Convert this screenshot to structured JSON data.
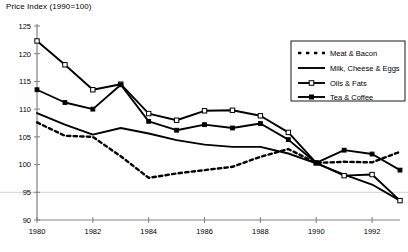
{
  "chart_data": {
    "type": "line",
    "title": "Price Index (1990=100)",
    "ylabel": "Price Index (1990=100)",
    "xlabel": "",
    "ylim": [
      90,
      125
    ],
    "xlim": [
      1980,
      1993
    ],
    "ytick_labels": [
      "90",
      "95",
      "100",
      "105",
      "110",
      "115",
      "120",
      "125"
    ],
    "yticks": [
      90,
      95,
      100,
      105,
      110,
      115,
      120,
      125
    ],
    "xtick_labels": [
      "1980",
      "1982",
      "1984",
      "1986",
      "1988",
      "1990",
      "1992"
    ],
    "xticks": [
      1980,
      1982,
      1984,
      1986,
      1988,
      1990,
      1992
    ],
    "grid": false,
    "legend_position": "top-right",
    "x": [
      1980,
      1981,
      1982,
      1983,
      1984,
      1985,
      1986,
      1987,
      1988,
      1989,
      1990,
      1991,
      1992,
      1993
    ],
    "series": [
      {
        "name": "Meat & Bacon",
        "style": "dashed",
        "marker": "none",
        "color": "#000000",
        "values": [
          107.6,
          105.2,
          105.0,
          101.5,
          97.6,
          98.4,
          99.0,
          99.6,
          101.4,
          102.8,
          100.3,
          100.5,
          100.4,
          102.3
        ]
      },
      {
        "name": "Milk, Cheese & Eggs",
        "style": "solid",
        "marker": "none",
        "color": "#000000",
        "values": [
          109.3,
          107.2,
          105.4,
          106.6,
          105.6,
          104.4,
          103.6,
          103.2,
          103.2,
          102.0,
          100.2,
          98.2,
          96.4,
          93.5
        ]
      },
      {
        "name": "Oils & Fats",
        "style": "solid",
        "marker": "square-open",
        "color": "#000000",
        "values": [
          122.3,
          118.0,
          113.5,
          114.5,
          109.2,
          108.0,
          109.7,
          109.8,
          108.8,
          105.8,
          100.3,
          98.0,
          98.2,
          93.5
        ]
      },
      {
        "name": "Tea & Coffee",
        "style": "solid",
        "marker": "square-filled",
        "color": "#000000",
        "values": [
          113.5,
          111.2,
          110.0,
          114.4,
          107.8,
          106.2,
          107.2,
          106.6,
          107.4,
          104.5,
          100.3,
          102.6,
          101.9,
          99.0
        ]
      }
    ]
  },
  "legend": {
    "entries": [
      {
        "label": "Meat & Bacon"
      },
      {
        "label": "Milk, Cheese & Eggs"
      },
      {
        "label": "Oils & Fats"
      },
      {
        "label": "Tea & Coffee"
      }
    ]
  }
}
